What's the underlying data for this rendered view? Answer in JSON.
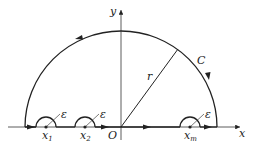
{
  "diagram": {
    "axes": {
      "x_label": "x",
      "y_label": "y",
      "origin_label": "O"
    },
    "contour_label": "C",
    "radius_label": "r",
    "indentations": [
      {
        "point": "x",
        "sub": "1",
        "radius_label": "ε"
      },
      {
        "point": "x",
        "sub": "2",
        "radius_label": "ε"
      },
      {
        "point": "x",
        "sub": "m",
        "radius_label": "ε"
      }
    ],
    "colors": {
      "stroke": "#222222",
      "background": "#ffffff"
    }
  }
}
